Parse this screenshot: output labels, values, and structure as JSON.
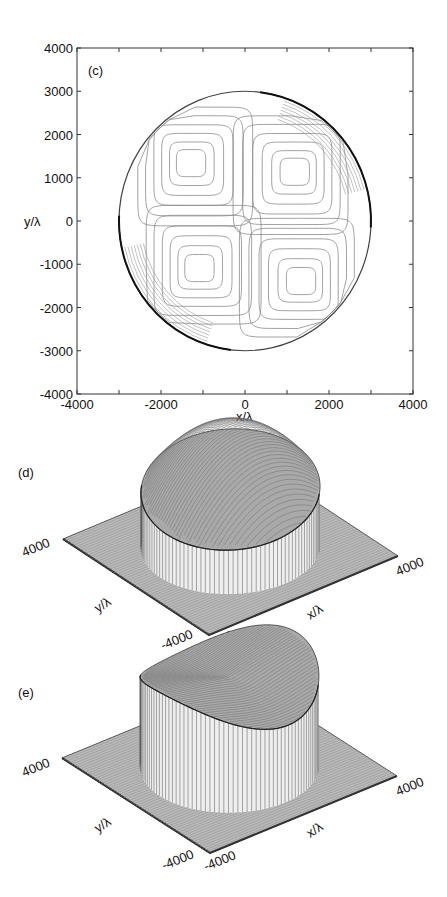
{
  "figure": {
    "panels": [
      {
        "id": "c",
        "label": "(c)",
        "type": "contour",
        "xlabel": "x/λ",
        "ylabel": "y/λ",
        "xlim": [
          -4000,
          4000
        ],
        "ylim": [
          -4000,
          4000
        ],
        "xticks": [
          "-4000",
          "-2000",
          "0",
          "2000",
          "4000"
        ],
        "yticks": [
          "4000",
          "3000",
          "2000",
          "1000",
          "0",
          "-1000",
          "-2000",
          "-3000",
          "-4000"
        ]
      },
      {
        "id": "d",
        "label": "(d)",
        "type": "surface-3d",
        "xlabel": "x/λ",
        "ylabel": "y/λ",
        "corner_labels": {
          "y_max": "4000",
          "y_min": "-4000",
          "x_min": "-4000",
          "x_max": "4000"
        }
      },
      {
        "id": "e",
        "label": "(e)",
        "type": "surface-3d",
        "xlabel": "x/λ",
        "ylabel": "y/λ",
        "corner_labels": {
          "y_max": "4000",
          "y_min": "-4000",
          "x_min": "-4000",
          "x_max": "4000"
        }
      }
    ]
  },
  "chart_data": [
    {
      "type": "contour",
      "title": "(c)",
      "xlabel": "x/λ",
      "ylabel": "y/λ",
      "xlim": [
        -4000,
        4000
      ],
      "ylim": [
        -4000,
        4000
      ],
      "x_ticks": [
        -4000,
        -2000,
        0,
        2000,
        4000
      ],
      "y_ticks": [
        -4000,
        -3000,
        -2000,
        -1000,
        0,
        1000,
        2000,
        3000,
        4000
      ],
      "domain": {
        "shape": "circle",
        "center": [
          0,
          0
        ],
        "radius": 3000
      },
      "extrema_centers": [
        {
          "quadrant": "upper-left",
          "x": -1300,
          "y": 1350
        },
        {
          "quadrant": "upper-right",
          "x": 1200,
          "y": 1150
        },
        {
          "quadrant": "lower-left",
          "x": -1100,
          "y": -1100
        },
        {
          "quadrant": "lower-right",
          "x": 1350,
          "y": -1400
        }
      ],
      "grid": false
    },
    {
      "type": "surface",
      "title": "(d)",
      "xlabel": "x/λ",
      "ylabel": "y/λ",
      "xlim": [
        -4000,
        4000
      ],
      "ylim": [
        -4000,
        4000
      ],
      "description": "Dome-shaped surface over circular aperture of radius ~3000, peaking near the back, with vertical wall at the aperture edge"
    },
    {
      "type": "surface",
      "title": "(e)",
      "xlabel": "x/λ",
      "ylabel": "y/λ",
      "xlim": [
        -4000,
        4000
      ],
      "ylim": [
        -4000,
        4000
      ],
      "description": "Flat-topped cylinder-like surface over circular aperture with a saddle-shaped top surface"
    }
  ],
  "layout": {
    "c_frame": {
      "x0": 77,
      "y0": 48,
      "x1": 413,
      "y1": 394
    },
    "d_corners": {
      "left": [
        63,
        539
      ],
      "front": [
        209,
        635
      ],
      "right": [
        398,
        556
      ],
      "back": [
        252,
        460
      ]
    },
    "e_corners": {
      "left": [
        62,
        758
      ],
      "front": [
        210,
        853
      ],
      "right": [
        397,
        776
      ],
      "back": [
        249,
        681
      ]
    }
  }
}
